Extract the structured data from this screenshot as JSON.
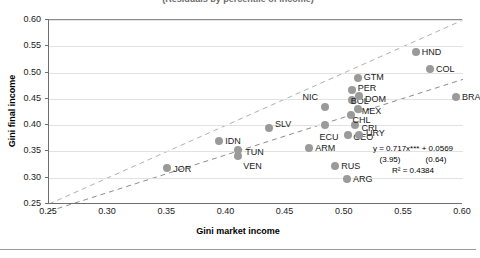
{
  "figure": {
    "title_cropped": "(Residuals by percentile of income)",
    "background": "#ffffff",
    "marker_color": "#9a9a9a",
    "gridline_color": "#e2e2e2",
    "axis_color": "#6f6f6f"
  },
  "chart_data": {
    "type": "scatter",
    "title": "",
    "xlabel": "Gini market income",
    "ylabel": "Gini final income",
    "xlim": [
      0.25,
      0.6
    ],
    "ylim": [
      0.25,
      0.6
    ],
    "xticks": [
      "0.25",
      "0.30",
      "0.35",
      "0.40",
      "0.45",
      "0.50",
      "0.55",
      "0.60"
    ],
    "yticks": [
      "0.25",
      "0.30",
      "0.35",
      "0.40",
      "0.45",
      "0.50",
      "0.55",
      "0.60"
    ],
    "grid": "horizontal",
    "legend": "none",
    "points": [
      {
        "label": "JOR",
        "x": 0.35,
        "y": 0.318,
        "lx": 6,
        "ly": 1
      },
      {
        "label": "IDN",
        "x": 0.394,
        "y": 0.37,
        "lx": 6,
        "ly": 0
      },
      {
        "label": "TUN",
        "x": 0.41,
        "y": 0.352,
        "lx": 7,
        "ly": 2
      },
      {
        "label": "VEN",
        "x": 0.41,
        "y": 0.342,
        "lx": 5,
        "ly": 10
      },
      {
        "label": "SLV",
        "x": 0.436,
        "y": 0.395,
        "lx": 6,
        "ly": -4
      },
      {
        "label": "ARM",
        "x": 0.47,
        "y": 0.357,
        "lx": 6,
        "ly": 0
      },
      {
        "label": "NIC",
        "x": 0.483,
        "y": 0.435,
        "lx": -22,
        "ly": -10
      },
      {
        "label": "ECU",
        "x": 0.483,
        "y": 0.4,
        "lx": -5,
        "ly": 12
      },
      {
        "label": "RUS",
        "x": 0.492,
        "y": 0.323,
        "lx": 6,
        "ly": 0
      },
      {
        "label": "ARG",
        "x": 0.502,
        "y": 0.298,
        "lx": 6,
        "ly": 0
      },
      {
        "label": "GEO",
        "x": 0.503,
        "y": 0.382,
        "lx": 5,
        "ly": 2
      },
      {
        "label": "URY",
        "x": 0.512,
        "y": 0.382,
        "lx": 7,
        "ly": -2
      },
      {
        "label": "CRI",
        "x": 0.509,
        "y": 0.4,
        "lx": 6,
        "ly": 3
      },
      {
        "label": "CHL",
        "x": 0.505,
        "y": 0.419,
        "lx": 2,
        "ly": 5
      },
      {
        "label": "MEX",
        "x": 0.511,
        "y": 0.43,
        "lx": 4,
        "ly": 2
      },
      {
        "label": "BOL",
        "x": 0.506,
        "y": 0.447,
        "lx": -1,
        "ly": 1
      },
      {
        "label": "DOM",
        "x": 0.512,
        "y": 0.455,
        "lx": 6,
        "ly": 3
      },
      {
        "label": "PER",
        "x": 0.506,
        "y": 0.466,
        "lx": 0,
        "ly": -2
      },
      {
        "label": "GTM",
        "x": 0.511,
        "y": 0.489,
        "lx": 6,
        "ly": -1
      },
      {
        "label": "HND",
        "x": 0.56,
        "y": 0.539,
        "lx": 6,
        "ly": 0
      },
      {
        "label": "COL",
        "x": 0.572,
        "y": 0.507,
        "lx": 6,
        "ly": 0
      },
      {
        "label": "BRA",
        "x": 0.594,
        "y": 0.453,
        "lx": 6,
        "ly": 0
      }
    ],
    "reference_line": {
      "name": "45-degree line",
      "style": "dashed",
      "from": [
        0.25,
        0.25
      ],
      "to": [
        0.6,
        0.6
      ]
    },
    "trend_line": {
      "name": "fitted regression",
      "style": "dashed",
      "slope": 0.717,
      "intercept": 0.0569,
      "from_x": 0.25,
      "to_x": 0.6
    },
    "annotation": {
      "equation": "y = 0.717x*** + 0.0569",
      "se_slope": "(3.95)",
      "se_intercept": "(0.64)",
      "r_squared": "R² = 0.4384"
    }
  }
}
